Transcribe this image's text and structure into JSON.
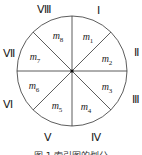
{
  "diagram": {
    "center": {
      "x": 72,
      "y": 71
    },
    "radius": 55,
    "divisions": 8,
    "stroke_color": "#333333",
    "center_dot": true
  },
  "outer_labels": [
    {
      "text": "Ⅰ",
      "x": 98,
      "y": 10
    },
    {
      "text": "Ⅱ",
      "x": 136,
      "y": 52
    },
    {
      "text": "Ⅲ",
      "x": 136,
      "y": 99
    },
    {
      "text": "Ⅳ",
      "x": 96,
      "y": 137
    },
    {
      "text": "Ⅴ",
      "x": 48,
      "y": 137
    },
    {
      "text": "Ⅵ",
      "x": 8,
      "y": 104
    },
    {
      "text": "Ⅶ",
      "x": 9,
      "y": 53
    },
    {
      "text": "Ⅷ",
      "x": 44,
      "y": 9
    }
  ],
  "sectors": [
    {
      "base": "m",
      "sub": "1",
      "x": 88,
      "y": 38
    },
    {
      "base": "m",
      "sub": "2",
      "x": 107,
      "y": 60
    },
    {
      "base": "m",
      "sub": "3",
      "x": 107,
      "y": 88
    },
    {
      "base": "m",
      "sub": "4",
      "x": 86,
      "y": 108
    },
    {
      "base": "m",
      "sub": "5",
      "x": 57,
      "y": 107
    },
    {
      "base": "m",
      "sub": "6",
      "x": 34,
      "y": 87
    },
    {
      "base": "m",
      "sub": "7",
      "x": 35,
      "y": 58
    },
    {
      "base": "m",
      "sub": "8",
      "x": 58,
      "y": 37
    }
  ],
  "caption": "图 1  索引图的划分"
}
